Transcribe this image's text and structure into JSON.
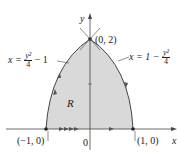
{
  "diagram": {
    "axes": {
      "x_label": "x",
      "y_label": "y",
      "origin_label": "0"
    },
    "points": [
      {
        "label": "(0, 2)"
      },
      {
        "label": "(−1, 0)"
      },
      {
        "label": "(1, 0)"
      }
    ],
    "region_label": "R",
    "curves": {
      "left": {
        "lhs": "x =",
        "num": "y²",
        "den": "4",
        "tail": "− 1"
      },
      "right": {
        "lhs": "x = 1 −",
        "num": "y²",
        "den": "4"
      }
    },
    "colors": {
      "region_fill": "#d9d9d9",
      "stroke": "#333333"
    }
  }
}
